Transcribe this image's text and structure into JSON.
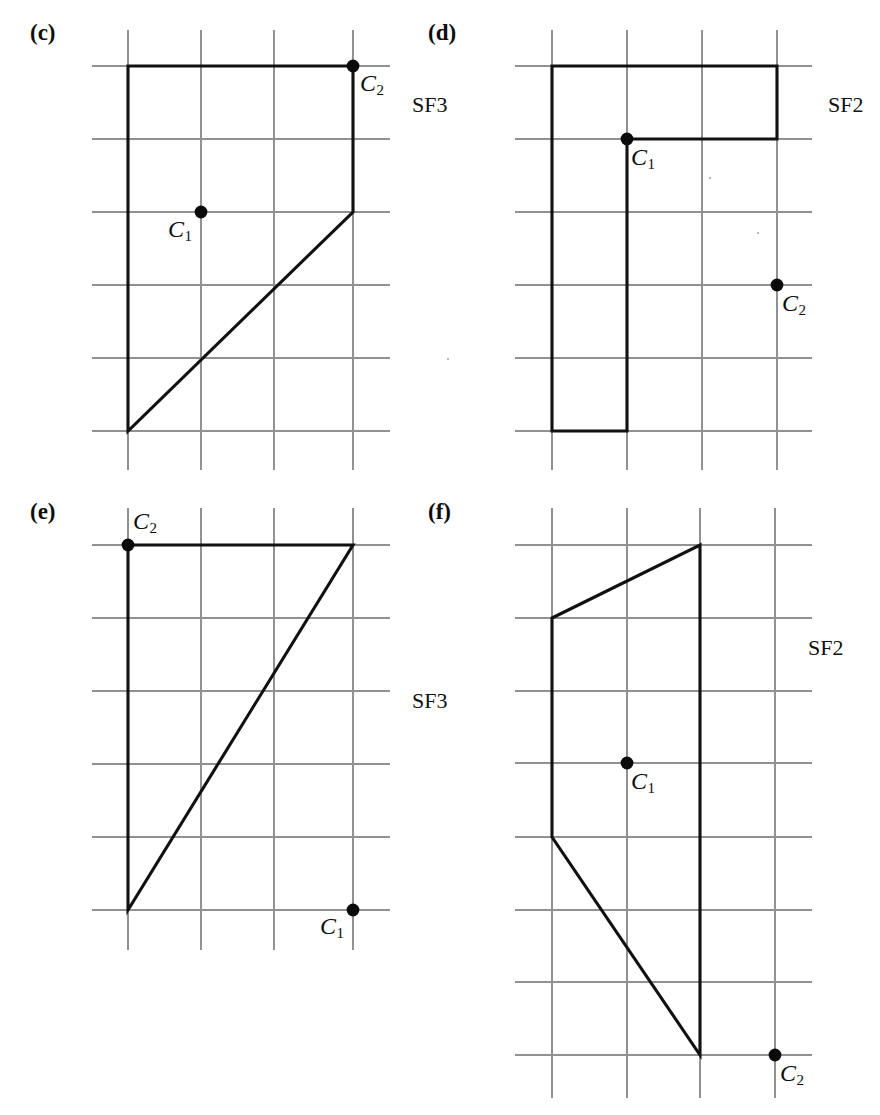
{
  "figure": {
    "width": 880,
    "height": 1115,
    "background_color": "#ffffff",
    "grid_color": "#919191",
    "shape_color": "#111111",
    "marker_color": "#0b0b0b",
    "grid_spacing_px": 73
  },
  "panels": [
    {
      "id": "c",
      "letter": "(c)",
      "letter_pos": {
        "x": 30,
        "y": 20
      },
      "sf_label": "SF3",
      "sf_label_pos": {
        "x": 412,
        "y": 92
      },
      "grid": {
        "x_lines": [
          128,
          201,
          274,
          353
        ],
        "y_lines": [
          66,
          139,
          212,
          285,
          358,
          431
        ],
        "x_extent": [
          92,
          390
        ],
        "y_extent": [
          30,
          470
        ]
      },
      "shape": {
        "kind": "polygon",
        "points": "128,66 353,66 353,212 128,431"
      },
      "markers": [
        {
          "name": "C2",
          "label": "C",
          "sub": "2",
          "x": 353,
          "y": 66,
          "label_pos": {
            "x": 360,
            "y": 70
          }
        },
        {
          "name": "C1",
          "label": "C",
          "sub": "1",
          "x": 201,
          "y": 212,
          "label_pos": {
            "x": 168,
            "y": 216
          }
        }
      ]
    },
    {
      "id": "d",
      "letter": "(d)",
      "letter_pos": {
        "x": 428,
        "y": 20
      },
      "sf_label": "SF2",
      "sf_label_pos": {
        "x": 828,
        "y": 92
      },
      "grid": {
        "x_lines": [
          552,
          627,
          702,
          777
        ],
        "y_lines": [
          66,
          139,
          212,
          285,
          358,
          431
        ],
        "x_extent": [
          515,
          812
        ],
        "y_extent": [
          30,
          470
        ]
      },
      "shape": {
        "kind": "polygon-closed",
        "points": "552,66 777,66 777,139 627,139 627,431 552,431"
      },
      "markers": [
        {
          "name": "C1",
          "label": "C",
          "sub": "1",
          "x": 627,
          "y": 139,
          "label_pos": {
            "x": 631,
            "y": 144
          }
        },
        {
          "name": "C2",
          "label": "C",
          "sub": "2",
          "x": 777,
          "y": 285,
          "label_pos": {
            "x": 782,
            "y": 290
          }
        }
      ]
    },
    {
      "id": "e",
      "letter": "(e)",
      "letter_pos": {
        "x": 30,
        "y": 499
      },
      "sf_label": "SF3",
      "sf_label_pos": {
        "x": 412,
        "y": 688
      },
      "grid": {
        "x_lines": [
          128,
          201,
          274,
          353
        ],
        "y_lines": [
          545,
          618,
          691,
          764,
          837,
          910
        ],
        "x_extent": [
          92,
          390
        ],
        "y_extent": [
          508,
          950
        ]
      },
      "shape": {
        "kind": "polygon-closed",
        "points": "128,545 353,545 128,910"
      },
      "markers": [
        {
          "name": "C2",
          "label": "C",
          "sub": "2",
          "x": 128,
          "y": 545,
          "label_pos": {
            "x": 133,
            "y": 508
          }
        },
        {
          "name": "C1",
          "label": "C",
          "sub": "1",
          "x": 353,
          "y": 910,
          "label_pos": {
            "x": 320,
            "y": 913
          }
        }
      ]
    },
    {
      "id": "f",
      "letter": "(f)",
      "letter_pos": {
        "x": 428,
        "y": 499
      },
      "sf_label": "SF2",
      "sf_label_pos": {
        "x": 808,
        "y": 635
      },
      "grid": {
        "x_lines": [
          552,
          627,
          700,
          775
        ],
        "y_lines": [
          545,
          618,
          691,
          763,
          837,
          910,
          982,
          1055
        ],
        "x_extent": [
          515,
          812
        ],
        "y_extent": [
          508,
          1098
        ]
      },
      "shape": {
        "kind": "polygon-closed",
        "points": "552,618 700,545 700,1055 552,837"
      },
      "markers": [
        {
          "name": "C1",
          "label": "C",
          "sub": "1",
          "x": 627,
          "y": 763,
          "label_pos": {
            "x": 631,
            "y": 768
          }
        },
        {
          "name": "C2",
          "label": "C",
          "sub": "2",
          "x": 775,
          "y": 1055,
          "label_pos": {
            "x": 780,
            "y": 1060
          }
        }
      ]
    }
  ]
}
